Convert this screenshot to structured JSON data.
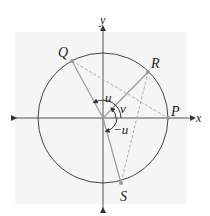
{
  "diagram": {
    "type": "unit-circle",
    "axes": {
      "x_label": "x",
      "y_label": "y"
    },
    "points": [
      {
        "id": "P",
        "label": "P"
      },
      {
        "id": "Q",
        "label": "Q"
      },
      {
        "id": "R",
        "label": "R"
      },
      {
        "id": "S",
        "label": "S"
      }
    ],
    "angles": [
      {
        "id": "u",
        "label": "u"
      },
      {
        "id": "v",
        "label": "v"
      },
      {
        "id": "neg_u",
        "label": "−u"
      }
    ],
    "colors": {
      "circle": "#444444",
      "radius": "#999999",
      "dashed": "#aaaaaa",
      "axis": "#555555",
      "point": "#999999",
      "panel": "#f5f5f5"
    }
  }
}
